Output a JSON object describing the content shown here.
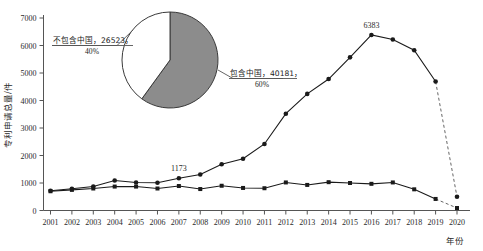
{
  "chart_data": {
    "type": "line",
    "title": "",
    "xlabel": "年份",
    "ylabel": "专利申请总量/件",
    "xlim": [
      2001,
      2020
    ],
    "ylim": [
      0,
      7000
    ],
    "ytick_labels": [
      "0",
      "1000",
      "2000",
      "3000",
      "4000",
      "5000",
      "6000",
      "7000"
    ],
    "ytick_values": [
      0,
      1000,
      2000,
      3000,
      4000,
      5000,
      6000,
      7000
    ],
    "grid": false,
    "legend_position": "none",
    "categories": [
      2001,
      2002,
      2003,
      2004,
      2005,
      2006,
      2007,
      2008,
      2009,
      2010,
      2011,
      2012,
      2013,
      2014,
      2015,
      2016,
      2017,
      2018,
      2019,
      2020
    ],
    "xtick_labels": [
      "2001",
      "2002",
      "2003",
      "2004",
      "2005",
      "2006",
      "2007",
      "2008",
      "2009",
      "2010",
      "2011",
      "2012",
      "2013",
      "2014",
      "2015",
      "2016",
      "2017",
      "2018",
      "2019",
      "2020"
    ],
    "series": [
      {
        "name": "包含中国",
        "marker": "circle",
        "values": [
          720,
          790,
          870,
          1090,
          1020,
          1010,
          1173,
          1310,
          1680,
          1880,
          2420,
          3520,
          4240,
          4780,
          5570,
          6383,
          6220,
          5830,
          4690,
          500
        ],
        "dashed_from": 2019
      },
      {
        "name": "不包含中国",
        "marker": "square",
        "values": [
          700,
          750,
          800,
          870,
          870,
          800,
          890,
          780,
          900,
          820,
          810,
          1020,
          930,
          1030,
          1000,
          970,
          1020,
          770,
          420,
          90
        ],
        "dashed_from": 2019
      }
    ],
    "annotations": [
      {
        "text": "6383",
        "x": 2016,
        "y": 6383
      },
      {
        "text": "1173",
        "x": 2007,
        "y": 1173
      }
    ],
    "inset_pie": {
      "type": "pie",
      "slices": [
        {
          "label": "包含中国",
          "value": 40181,
          "percent": "60%",
          "percent_value": 60,
          "color": "#8c8c8c"
        },
        {
          "label": "不包含中国",
          "value": 26523,
          "percent": "40%",
          "percent_value": 40,
          "color": "#ffffff"
        }
      ],
      "labels": [
        {
          "line1": "不包含中国，26523，",
          "line2": "40%"
        },
        {
          "line1": "包含中国，40181，",
          "line2": "60%"
        }
      ]
    }
  },
  "colors": {
    "line": "#1a1a1a",
    "axis": "#555555",
    "pie_gray": "#8c8c8c",
    "pie_white": "#ffffff",
    "text": "#1a1a1a"
  }
}
